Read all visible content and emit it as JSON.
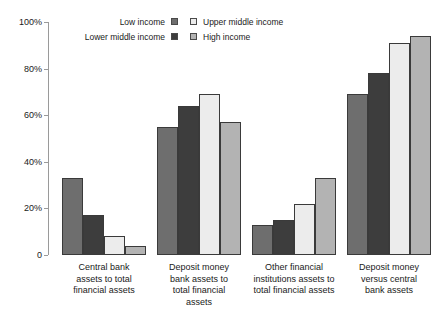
{
  "chart_data": {
    "type": "bar",
    "title": "",
    "xlabel": "",
    "ylabel": "",
    "ylim": [
      0,
      100
    ],
    "ytick_labels": [
      "0",
      "20%",
      "40%",
      "60%",
      "80%",
      "100%"
    ],
    "ytick_values": [
      0,
      20,
      40,
      60,
      80,
      100
    ],
    "grid": false,
    "legend_position": "top-left",
    "categories": [
      "Central bank assets to total financial assets",
      "Deposit money bank assets to total financial assets",
      "Other financial institutions assets to total financial assets",
      "Deposit money versus central bank assets"
    ],
    "category_lines": [
      [
        "Central bank",
        "assets to total",
        "financial assets"
      ],
      [
        "Deposit money",
        "bank assets to",
        "total financial",
        "assets"
      ],
      [
        "Other financial",
        "institutions assets to",
        "total financial assets"
      ],
      [
        "Deposit money",
        "versus central",
        "bank assets"
      ]
    ],
    "series": [
      {
        "name": "Low income",
        "color": "#6e6e6e",
        "values": [
          33,
          55,
          13,
          69
        ]
      },
      {
        "name": "Lower middle income",
        "color": "#3d3d3d",
        "values": [
          17,
          64,
          15,
          78
        ]
      },
      {
        "name": "Upper middle income",
        "color": "#ececec",
        "values": [
          8,
          69,
          22,
          91
        ]
      },
      {
        "name": "High income",
        "color": "#b3b3b3",
        "values": [
          4,
          57,
          33,
          94
        ]
      }
    ]
  },
  "legend": {
    "left_column": [
      {
        "label": "Low income",
        "color": "#6e6e6e"
      },
      {
        "label": "Lower middle income",
        "color": "#3d3d3d"
      }
    ],
    "right_column": [
      {
        "label": "Upper middle income",
        "color": "#ececec"
      },
      {
        "label": "High income",
        "color": "#b3b3b3"
      }
    ]
  }
}
